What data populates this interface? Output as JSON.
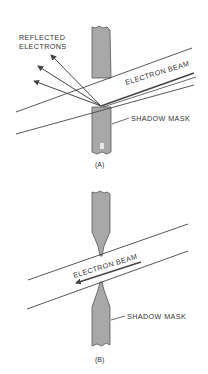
{
  "figure_a": {
    "reflected_label_line1": "REFLECTED",
    "reflected_label_line2": "ELECTRONS",
    "beam_label": "ELECTRON BEAM",
    "mask_label": "SHADOW MASK",
    "caption": "(A)"
  },
  "figure_b": {
    "beam_label": "ELECTRON BEAM",
    "mask_label": "SHADOW MASK",
    "caption": "(B)"
  },
  "colors": {
    "mask_fill": "#a8a8a8",
    "line": "#444444",
    "text": "#333333"
  }
}
